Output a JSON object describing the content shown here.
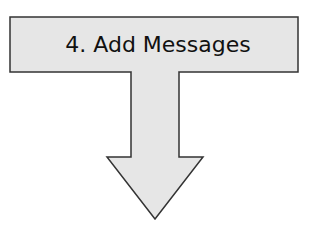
{
  "diagram": {
    "step": {
      "label": "4. Add Messages",
      "number": 4,
      "title": "Add Messages"
    },
    "arrow": {
      "direction": "down"
    },
    "colors": {
      "fill": "#e6e6e6",
      "stroke": "#333333",
      "text": "#111111",
      "background": "#ffffff"
    }
  }
}
